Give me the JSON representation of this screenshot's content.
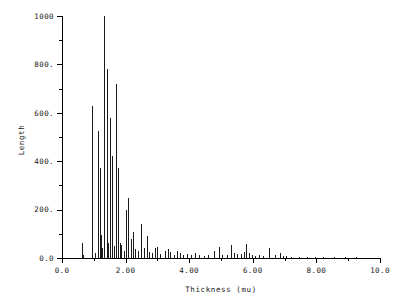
{
  "chart_data": {
    "type": "bar",
    "title": "",
    "subtitle": "",
    "xlabel": "Thickness  (mu)",
    "ylabel": "Length",
    "xlim": [
      0.0,
      10.0
    ],
    "ylim": [
      0.0,
      1000.0
    ],
    "grid": false,
    "legend": null,
    "legend_position": "none",
    "style": "impulse/stem spike plot, thin vertical lines from baseline",
    "x_ticks_major": [
      0.0,
      2.0,
      4.0,
      6.0,
      8.0,
      10.0
    ],
    "x_tick_labels": [
      "0.0",
      "2.00",
      "4.00",
      "6.00",
      "8.00",
      "10.0"
    ],
    "x_ticks_minor": [
      1.0,
      3.0,
      5.0,
      7.0,
      9.0
    ],
    "y_ticks_major": [
      0.0,
      200.0,
      400.0,
      600.0,
      800.0,
      1000.0
    ],
    "y_tick_labels": [
      "0.0",
      "200.",
      "400.",
      "600.",
      "800.",
      "1000"
    ],
    "y_ticks_minor": [
      100.0,
      300.0,
      500.0,
      700.0,
      900.0
    ],
    "x": [
      0.62,
      0.66,
      0.95,
      1.05,
      1.13,
      1.18,
      1.22,
      1.27,
      1.33,
      1.4,
      1.46,
      1.51,
      1.57,
      1.63,
      1.7,
      1.76,
      1.82,
      1.87,
      1.95,
      2.02,
      2.09,
      2.16,
      2.23,
      2.31,
      2.39,
      2.48,
      2.58,
      2.66,
      2.74,
      2.82,
      2.92,
      3.0,
      3.08,
      3.24,
      3.32,
      3.41,
      3.52,
      3.62,
      3.72,
      3.82,
      3.94,
      4.06,
      4.18,
      4.3,
      4.45,
      4.6,
      4.78,
      4.94,
      5.02,
      5.18,
      5.32,
      5.42,
      5.5,
      5.62,
      5.72,
      5.8,
      5.88,
      5.96,
      6.06,
      6.18,
      6.32,
      6.5,
      6.7,
      6.84,
      6.96,
      7.04,
      7.2,
      7.45,
      7.7,
      7.95,
      8.22,
      8.55,
      8.9,
      9.25,
      9.55
    ],
    "values": [
      62,
      14,
      630,
      20,
      525,
      370,
      95,
      42,
      1000,
      780,
      62,
      580,
      420,
      48,
      720,
      372,
      60,
      55,
      30,
      200,
      250,
      80,
      108,
      36,
      28,
      142,
      40,
      90,
      24,
      20,
      42,
      46,
      18,
      30,
      36,
      26,
      14,
      30,
      20,
      12,
      16,
      14,
      20,
      12,
      10,
      14,
      30,
      44,
      12,
      14,
      52,
      22,
      16,
      18,
      26,
      58,
      22,
      14,
      10,
      12,
      8,
      40,
      12,
      20,
      10,
      8,
      6,
      5,
      5,
      4,
      4,
      3,
      3,
      3,
      2
    ]
  },
  "axes": {
    "ylabel": "Length",
    "xlabel": "Thickness  (mu)"
  }
}
